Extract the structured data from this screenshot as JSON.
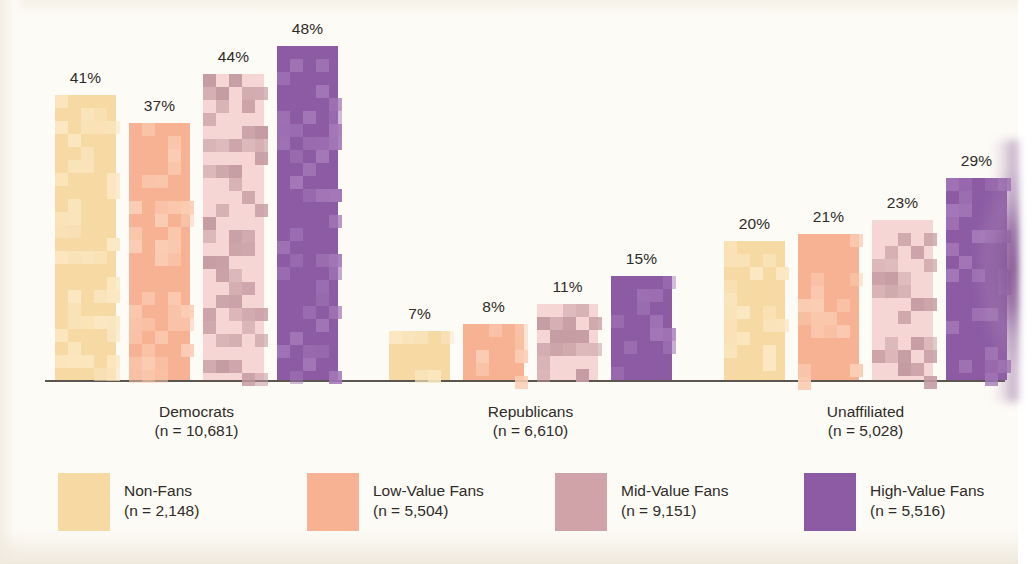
{
  "chart_data": {
    "type": "bar",
    "title": "",
    "subtitle": "",
    "xlabel": "",
    "ylabel": "",
    "ylim": [
      0,
      55
    ],
    "grid": false,
    "legend_position": "bottom",
    "categories": [
      "Democrats",
      "Republicans",
      "Unaffiliated"
    ],
    "category_notes": [
      "(n = 10,681)",
      "(n = 6,610)",
      "(n = 5,028)"
    ],
    "series": [
      {
        "name": "Non-Fans",
        "note": "(n = 2,148)",
        "color": "#f7d9a4",
        "pattern_color": "#fbe8c4",
        "values": [
          41,
          7,
          20
        ],
        "labels": [
          "41%",
          "7%",
          "20%"
        ]
      },
      {
        "name": "Low-Value Fans",
        "note": "(n = 5,504)",
        "color": "#f6b293",
        "pattern_color": "#fbcdb5",
        "values": [
          37,
          8,
          21
        ],
        "labels": [
          "37%",
          "8%",
          "21%"
        ]
      },
      {
        "name": "Mid-Value Fans",
        "note": "(n = 9,151)",
        "color": "#f6d6d4",
        "pattern_color": "#c39aa0",
        "values": [
          44,
          11,
          23
        ],
        "labels": [
          "44%",
          "11%",
          "23%"
        ]
      },
      {
        "name": "High-Value Fans",
        "note": "(n = 5,516)",
        "color": "#8c5ba4",
        "pattern_color": "#a478b8",
        "values": [
          48,
          15,
          29
        ],
        "labels": [
          "48%",
          "15%",
          "29%"
        ]
      }
    ]
  },
  "groups": [
    {
      "label": "Democrats",
      "note": "(n = 10,681)",
      "bars": [
        {
          "series": "Non-Fans",
          "label": "41%"
        },
        {
          "series": "Low-Value Fans",
          "label": "37%"
        },
        {
          "series": "Mid-Value Fans",
          "label": "44%"
        },
        {
          "series": "High-Value Fans",
          "label": "48%"
        }
      ]
    },
    {
      "label": "Republicans",
      "note": "(n = 6,610)",
      "bars": [
        {
          "series": "Non-Fans",
          "label": "7%"
        },
        {
          "series": "Low-Value Fans",
          "label": "8%"
        },
        {
          "series": "Mid-Value Fans",
          "label": "11%"
        },
        {
          "series": "High-Value Fans",
          "label": "15%"
        }
      ]
    },
    {
      "label": "Unaffiliated",
      "note": "(n = 5,028)",
      "bars": [
        {
          "series": "Non-Fans",
          "label": "20%"
        },
        {
          "series": "Low-Value Fans",
          "label": "21%"
        },
        {
          "series": "Mid-Value Fans",
          "label": "23%"
        },
        {
          "series": "High-Value Fans",
          "label": "29%"
        }
      ]
    }
  ],
  "legend": {
    "items": [
      {
        "label": "Non-Fans",
        "note": "(n = 2,148)",
        "color": "#f7d9a4"
      },
      {
        "label": "Low-Value Fans",
        "note": "(n = 5,504)",
        "color": "#f6b293"
      },
      {
        "label": "Mid-Value Fans",
        "note": "(n = 9,151)",
        "color": "#cfa3a8"
      },
      {
        "label": "High-Value Fans",
        "note": "(n = 5,516)",
        "color": "#8c5ba4"
      }
    ]
  },
  "colors": {
    "background": "#fdfbf6",
    "axis": "#5c564e",
    "text": "#2e2b28",
    "non_fans": "#f7d9a4",
    "low_value_fans": "#f6b293",
    "mid_value_fans": "#cfa3a8",
    "high_value_fans": "#8c5ba4"
  }
}
